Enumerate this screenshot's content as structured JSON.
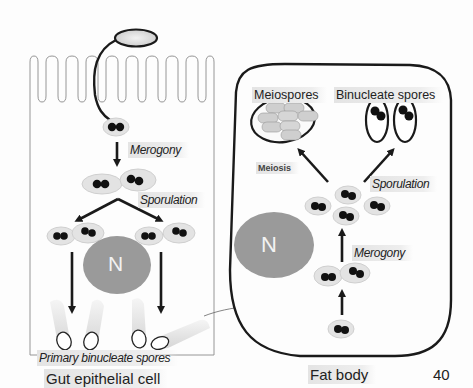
{
  "diagram": {
    "left_panel": {
      "title": "Gut epithelial cell",
      "labels": {
        "merogony": "Merogony",
        "sporulation": "Sporulation",
        "primary_spores": "Primary binucleate spores",
        "nucleus": "N"
      }
    },
    "right_panel": {
      "title": "Fat body",
      "labels": {
        "meiospores": "Meiospores",
        "binucleate_spores": "Binucleate spores",
        "meiosis": "Meiosis",
        "sporulation": "Sporulation",
        "merogony": "Merogony",
        "nucleus": "N"
      }
    },
    "slide_number": "40",
    "colors": {
      "outline": "#1a1a1a",
      "cell_fill": "#e6e6e6",
      "nucleus_fill": "#9a9a9a",
      "spore_dot": "#111111"
    }
  }
}
